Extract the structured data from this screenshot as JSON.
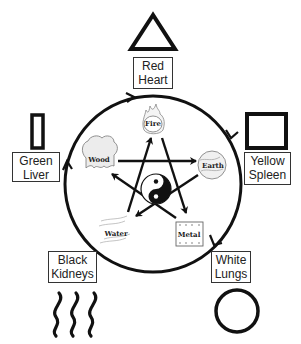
{
  "diagram": {
    "type": "five-elements-cycle",
    "center_symbol": "yin-yang",
    "elements": [
      {
        "name": "Fire",
        "icon": "flame-icon"
      },
      {
        "name": "Earth",
        "icon": "globe-icon"
      },
      {
        "name": "Metal",
        "icon": "metal-plate-icon"
      },
      {
        "name": "Water",
        "icon": "water-waves-icon"
      },
      {
        "name": "Wood",
        "icon": "tree-icon"
      }
    ],
    "organs": [
      {
        "color": "Red",
        "organ": "Heart",
        "shape": "triangle"
      },
      {
        "color": "Yellow",
        "organ": "Spleen",
        "shape": "square"
      },
      {
        "color": "White",
        "organ": "Lungs",
        "shape": "circle"
      },
      {
        "color": "Black",
        "organ": "Kidneys",
        "shape": "wavy-lines"
      },
      {
        "color": "Green",
        "organ": "Liver",
        "shape": "tall-rectangle"
      }
    ],
    "generating_cycle": "clockwise outer circle: Wood → Fire → Earth → Metal → Water → Wood",
    "controlling_cycle": "inner star: Wood → Earth → Water → Fire → Metal → Wood"
  },
  "colors": {
    "line": "#111111",
    "box_border": "#333333",
    "background": "#ffffff"
  }
}
